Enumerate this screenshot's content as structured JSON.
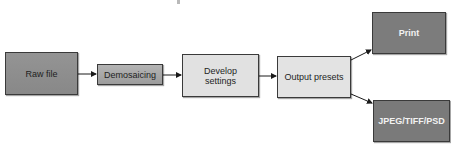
{
  "diagram": {
    "type": "flowchart",
    "nodes": [
      {
        "id": "raw",
        "label": "Raw file",
        "x": 5,
        "y": 52,
        "w": 73,
        "h": 43,
        "fill": "#8e8e8e",
        "text_color": "#1e1e1e",
        "style": "medium"
      },
      {
        "id": "demosaic",
        "label": "Demosaicing",
        "x": 97,
        "y": 64,
        "w": 66,
        "h": 21,
        "fill": "#a9a9a9",
        "text_color": "#1e1e1e",
        "style": "medium"
      },
      {
        "id": "develop",
        "label": "Develop\nsettings",
        "x": 182,
        "y": 54,
        "w": 77,
        "h": 43,
        "fill": "#e1e1e1",
        "text_color": "#1e1e1e",
        "style": "light"
      },
      {
        "id": "output",
        "label": "Output presets",
        "x": 277,
        "y": 56,
        "w": 74,
        "h": 42,
        "fill": "#e3e3e3",
        "text_color": "#1e1e1e",
        "style": "light"
      },
      {
        "id": "print",
        "label": "Print",
        "x": 372,
        "y": 12,
        "w": 74,
        "h": 42,
        "fill": "#7c7c7c",
        "text_color": "#f2f2f2",
        "style": "dark"
      },
      {
        "id": "jpeg",
        "label": "JPEG/TIFF/PSD",
        "x": 373,
        "y": 100,
        "w": 77,
        "h": 42,
        "fill": "#7a7a7a",
        "text_color": "#f2f2f2",
        "style": "dark"
      }
    ],
    "edges": [
      {
        "from": "raw",
        "to": "demosaic",
        "x1": 78,
        "y1": 74,
        "x2": 96,
        "y2": 74
      },
      {
        "from": "demosaic",
        "to": "develop",
        "x1": 163,
        "y1": 75,
        "x2": 181,
        "y2": 75
      },
      {
        "from": "develop",
        "to": "output",
        "x1": 259,
        "y1": 76,
        "x2": 276,
        "y2": 76
      },
      {
        "from": "output",
        "to": "print",
        "x1": 351,
        "y1": 60,
        "x2": 371,
        "y2": 50
      },
      {
        "from": "output",
        "to": "jpeg",
        "x1": 351,
        "y1": 94,
        "x2": 372,
        "y2": 103
      }
    ],
    "colors": {
      "border": "#3a3a3a",
      "arrow": "#1a1a1a",
      "background": "#ffffff"
    }
  }
}
